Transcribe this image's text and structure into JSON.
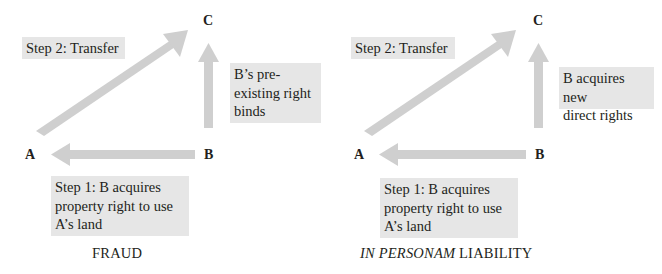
{
  "colors": {
    "arrow": "#cfcfcf",
    "box_fill": "#e6e6e6",
    "text": "#231f20"
  },
  "panels": [
    {
      "caption": "FRAUD",
      "nodes": {
        "a": "A",
        "b": "B",
        "c": "C"
      },
      "step2": "Step 2: Transfer",
      "right_box": [
        "B’s pre-",
        "existing right",
        "binds"
      ],
      "step1": [
        "Step 1: B acquires",
        "property right to use",
        "A’s land"
      ]
    },
    {
      "caption_italic": "IN PERSONAM",
      "caption_rest": " LIABILITY",
      "nodes": {
        "a": "A",
        "b": "B",
        "c": "C"
      },
      "step2": "Step 2: Transfer",
      "right_box": [
        "B acquires new",
        "direct rights"
      ],
      "step1": [
        "Step 1: B acquires",
        "property right to use",
        "A’s land"
      ]
    }
  ]
}
